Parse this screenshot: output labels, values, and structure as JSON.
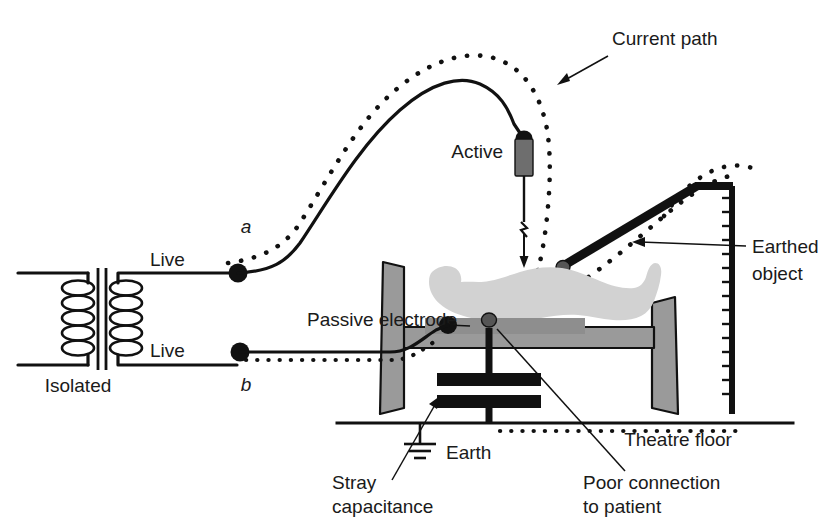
{
  "diagram": {
    "labels": {
      "current_path": "Current path",
      "active": "Active",
      "earthed_object": "Earthed\nobject",
      "earthed_object_line1": "Earthed",
      "earthed_object_line2": "object",
      "live_upper": "Live",
      "live_lower": "Live",
      "isolated": "Isolated",
      "node_a": "a",
      "node_b": "b",
      "passive_electrode": "Passive electrode",
      "earth": "Earth",
      "stray_capacitance_line1": "Stray",
      "stray_capacitance_line2": "capacitance",
      "poor_connection_line1": "Poor connection",
      "poor_connection_line2": "to patient",
      "theatre_floor": "Theatre floor"
    },
    "colors": {
      "ink": "#111111",
      "patient_fill": "#d2d2d2",
      "table_fill": "#9a9a9a",
      "pad_fill": "#8e8e8e",
      "handle_fill": "#6e6e6e",
      "background": "#ffffff"
    },
    "components": {
      "transformer_windings": 5,
      "capacitor_plates": 2,
      "terminals": [
        "a",
        "b"
      ]
    }
  }
}
